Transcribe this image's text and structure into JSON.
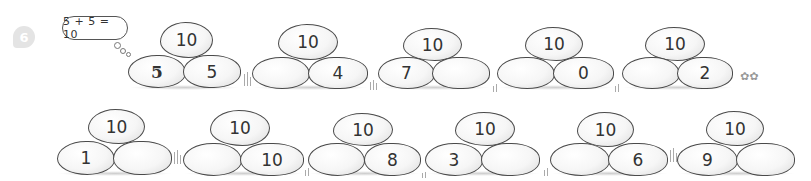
{
  "problem_number": "6",
  "example_bubble": "5 + 5 = 10",
  "rows": [
    {
      "groups": [
        {
          "top": "10",
          "left": "5",
          "right": "5",
          "left_style": "handwritten"
        },
        {
          "top": "10",
          "left": "",
          "right": "4"
        },
        {
          "top": "10",
          "left": "7",
          "right": ""
        },
        {
          "top": "10",
          "left": "",
          "right": "0"
        },
        {
          "top": "10",
          "left": "",
          "right": "2"
        }
      ]
    },
    {
      "groups": [
        {
          "top": "10",
          "left": "1",
          "right": ""
        },
        {
          "top": "10",
          "left": "",
          "right": "10"
        },
        {
          "top": "10",
          "left": "",
          "right": "8"
        },
        {
          "top": "10",
          "left": "3",
          "right": ""
        },
        {
          "top": "10",
          "left": "",
          "right": "6"
        },
        {
          "top": "10",
          "left": "9",
          "right": ""
        }
      ]
    }
  ],
  "decorations": [
    "grass-icon",
    "flower-icon"
  ]
}
